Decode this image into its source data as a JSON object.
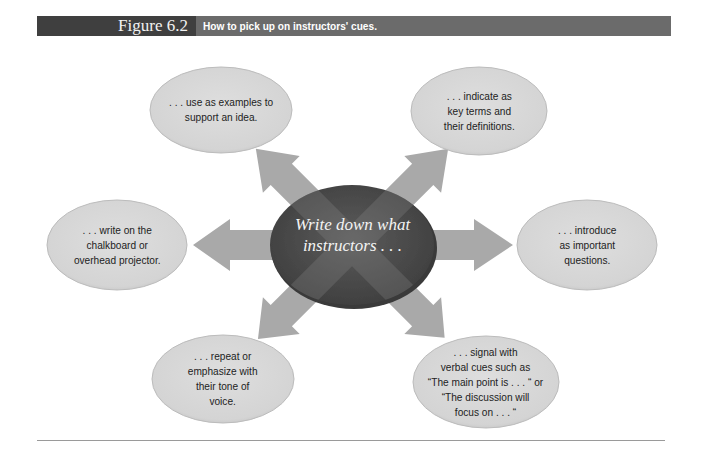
{
  "header": {
    "figure_number": "Figure 6.2",
    "caption": "How to pick up on instructors' cues."
  },
  "center": {
    "text": "Write down what\ninstructors . . ."
  },
  "bubbles": [
    {
      "id": "top-left",
      "text": ". . . use as examples to\nsupport an idea."
    },
    {
      "id": "top-right",
      "text": ". . . indicate as\nkey terms and\ntheir definitions."
    },
    {
      "id": "left",
      "text": ". . . write on the\nchalkboard or\noverhead projector."
    },
    {
      "id": "right",
      "text": ". . . introduce\nas important\nquestions."
    },
    {
      "id": "bottom-left",
      "text": ". . . repeat or\nemphasize with\ntheir tone of\nvoice."
    },
    {
      "id": "bottom-right",
      "text": ". . . signal with\nverbal cues such as\n“The main point is . . . “ or\n“The discussion will\nfocus on . . . “"
    }
  ],
  "colors": {
    "title_dark": "#3f3f3f",
    "title_mid": "#6b6b6b",
    "bubble_fill": "#d9d9d9",
    "bubble_edge": "#bdbdbd",
    "arrow_fill": "#a8a8a8",
    "center_fill": "#555555"
  }
}
